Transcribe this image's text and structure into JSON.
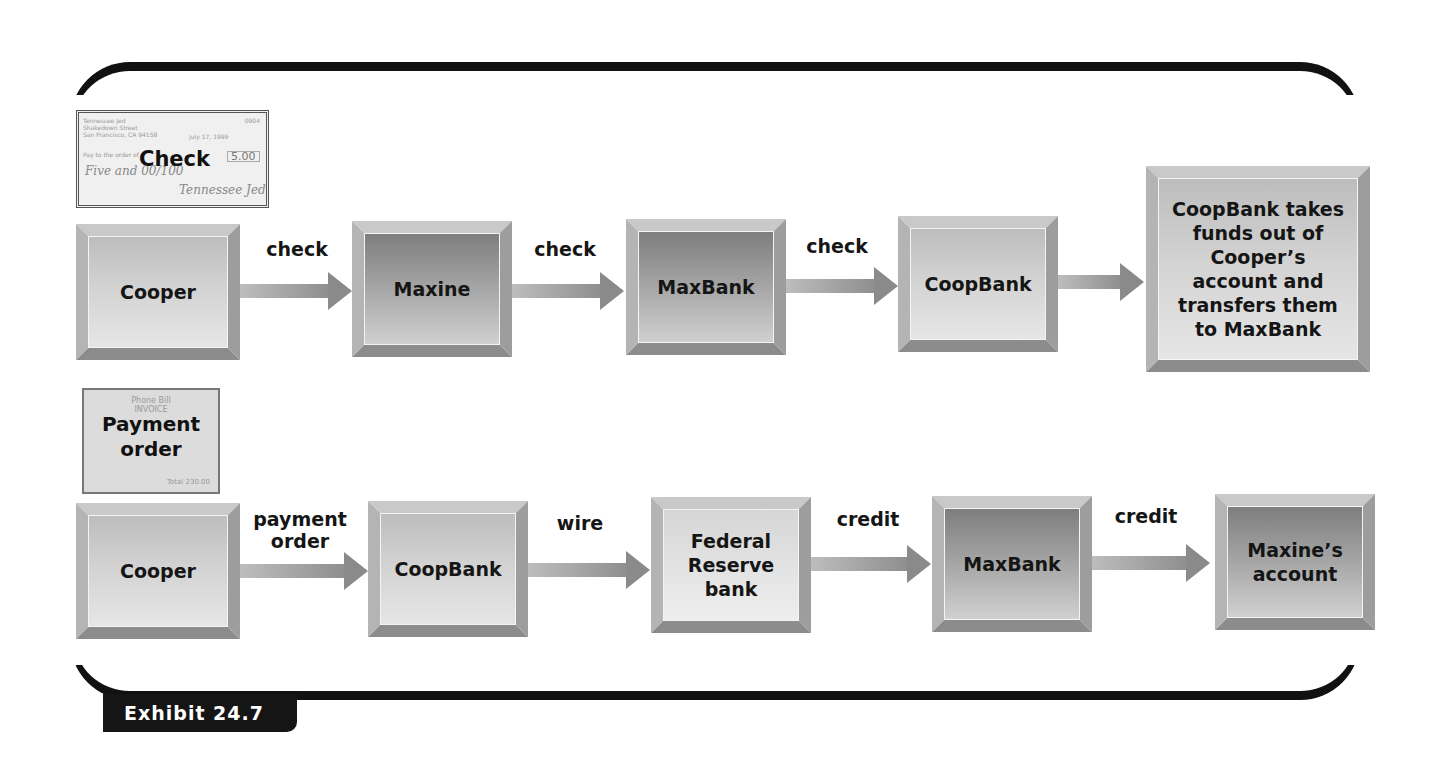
{
  "exhibit": {
    "label": "Exhibit 24.7"
  },
  "check_doc": {
    "title": "Check",
    "payer_name": "Tennessee Jed",
    "payer_street": "Shakedown Street",
    "payer_city": "San Francisco, CA 94158",
    "check_number": "0904",
    "date": "July 17, 1999",
    "pay_to_label": "Pay to the order of",
    "amount": "5.00",
    "amount_words": "Five and 00/100",
    "signature": "Tennessee Jed"
  },
  "invoice_doc": {
    "title_line1": "Payment",
    "title_line2": "order",
    "header_line1": "Phone Bill",
    "header_line2": "INVOICE",
    "total_label": "Total",
    "total_value": "230.00"
  },
  "rows": [
    {
      "name": "check-flow",
      "nodes": [
        {
          "label": "Cooper",
          "shade": "light"
        },
        {
          "label": "Maxine",
          "shade": "dark"
        },
        {
          "label": "MaxBank",
          "shade": "dark"
        },
        {
          "label": "CoopBank",
          "shade": "light"
        },
        {
          "label": "CoopBank takes funds out of Cooper’s account and transfers them to MaxBank",
          "shade": "light"
        }
      ],
      "edges": [
        "check",
        "check",
        "check",
        ""
      ]
    },
    {
      "name": "payment-order-flow",
      "nodes": [
        {
          "label": "Cooper",
          "shade": "light"
        },
        {
          "label": "CoopBank",
          "shade": "light"
        },
        {
          "label": "Federal Reserve bank",
          "shade": "pale"
        },
        {
          "label": "MaxBank",
          "shade": "dark"
        },
        {
          "label": "Maxine’s account",
          "shade": "dark"
        }
      ],
      "edges": [
        "payment order",
        "wire",
        "credit",
        "credit"
      ]
    }
  ]
}
